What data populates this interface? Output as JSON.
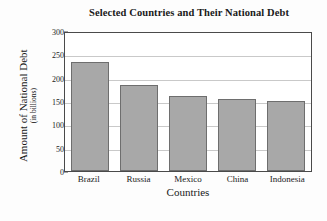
{
  "chart_data": {
    "type": "bar",
    "title": "Selected Countries and Their National Debt",
    "xlabel": "Countries",
    "ylabel": "Amount of National Debt",
    "ylabel_sub": "(in billions)",
    "categories": [
      "Brazil",
      "Russia",
      "Mexico",
      "China",
      "Indonesia"
    ],
    "values": [
      233,
      185,
      160,
      155,
      150
    ],
    "yticks": [
      0,
      50,
      100,
      150,
      200,
      250,
      300
    ],
    "ylim": [
      0,
      300
    ],
    "grid": true,
    "legend": "none",
    "bar_color": "#a8a8a8",
    "bar_edge_color": "#6e6e6e",
    "axis_color": "#4a4a4a",
    "gridline_color": "#c9c9c9",
    "background_color": "#ffffff"
  }
}
